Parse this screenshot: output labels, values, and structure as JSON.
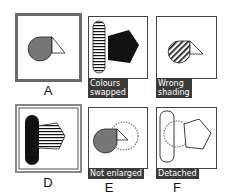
{
  "figure": {
    "colors": {
      "grey_fill": "#777777",
      "dark_border": "#666666",
      "black": "#111111",
      "tag_bg": "#3a3a3a",
      "tag_text": "#ffffff"
    },
    "panels": [
      {
        "id": "A",
        "letter": "A",
        "caption": "",
        "description": "Grey teardrop with white triangle; thick grey border (correct answer)"
      },
      {
        "id": "B",
        "letter": "",
        "caption_line1": "Colours",
        "caption_line2": "swapped",
        "description": "Striped rounded bar with black pentagon"
      },
      {
        "id": "C",
        "letter": "",
        "caption_line1": "Wrong",
        "caption_line2": "shading",
        "description": "Diagonally hatched teardrop with white triangle"
      },
      {
        "id": "D",
        "letter": "D",
        "caption": "",
        "description": "Black rounded bar with horizontally striped pentagon; double grey border"
      },
      {
        "id": "E",
        "letter": "E",
        "caption": "Not enlarged",
        "description": "Grey teardrop with triangle and dotted circle outline"
      },
      {
        "id": "F",
        "letter": "F",
        "caption": "Detached",
        "description": "Outlined rounded bar, dotted circle and outlined pentagon"
      }
    ]
  }
}
